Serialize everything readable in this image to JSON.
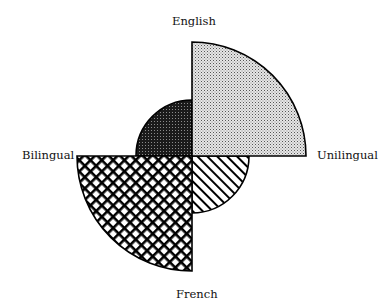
{
  "chart_data": {
    "type": "polar-area",
    "title": "",
    "axes": {
      "top": "English",
      "bottom": "French",
      "left": "Bilingual",
      "right": "Unilingual"
    },
    "categories": [
      "English-Unilingual",
      "English-Bilingual",
      "French-Bilingual",
      "French-Unilingual"
    ],
    "values": [
      114,
      56,
      115,
      57
    ],
    "value_note": "relative radii (no numeric scale shown)",
    "segments": [
      {
        "name": "English-Unilingual",
        "quadrant": "top-right",
        "radius": 114,
        "pattern": "light-dots"
      },
      {
        "name": "English-Bilingual",
        "quadrant": "top-left",
        "radius": 56,
        "pattern": "dark-dots"
      },
      {
        "name": "French-Bilingual",
        "quadrant": "bottom-left",
        "radius": 115,
        "pattern": "crosshatch"
      },
      {
        "name": "French-Unilingual",
        "quadrant": "bottom-right",
        "radius": 57,
        "pattern": "diagonal-stripes"
      }
    ],
    "grid": false,
    "legend": "none"
  },
  "labels": {
    "english": "English",
    "french": "French",
    "bilingual": "Bilingual",
    "unilingual": "Unilingual"
  }
}
